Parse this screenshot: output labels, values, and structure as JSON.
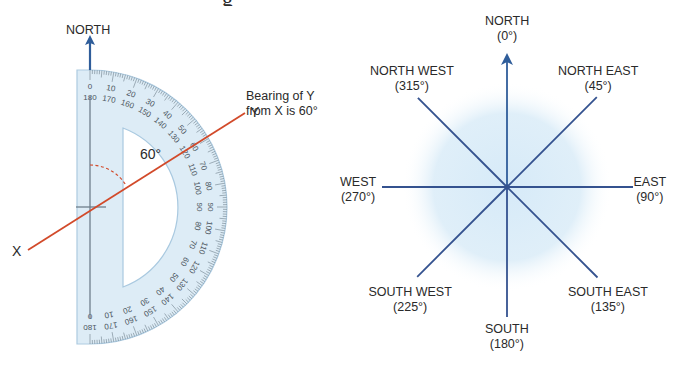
{
  "title_fragment": "g",
  "colors": {
    "north_arrow": "#2f5d9a",
    "compass_line": "#34528f",
    "bearing_line": "#d24a2a",
    "protractor_fill": "#dcecf6",
    "protractor_edge": "#a9c9e0",
    "tick": "#6f7f8c",
    "text": "#2a2a2a",
    "glow": "#cfe5f5"
  },
  "left_panel": {
    "north_label": "NORTH",
    "annotation_line1": "Bearing of Y",
    "annotation_line2": "from X is 60°",
    "point_x_label": "X",
    "point_y_label": "Y",
    "angle_label": "60°",
    "bearing_degrees": 60,
    "protractor": {
      "outer_scale": [
        0,
        10,
        20,
        30,
        40,
        50,
        60,
        70,
        80,
        90,
        100,
        110,
        120,
        130,
        140,
        150,
        160,
        170,
        180
      ],
      "inner_scale": [
        180,
        170,
        160,
        150,
        140,
        130,
        120,
        110,
        100,
        90,
        80,
        70,
        60,
        50,
        40,
        30,
        20,
        10,
        0
      ]
    }
  },
  "right_panel": {
    "directions": [
      {
        "name": "NORTH",
        "degrees": "(0°)",
        "angle": 0
      },
      {
        "name": "NORTH EAST",
        "degrees": "(45°)",
        "angle": 45
      },
      {
        "name": "EAST",
        "degrees": "(90°)",
        "angle": 90
      },
      {
        "name": "SOUTH EAST",
        "degrees": "(135°)",
        "angle": 135
      },
      {
        "name": "SOUTH",
        "degrees": "(180°)",
        "angle": 180
      },
      {
        "name": "SOUTH WEST",
        "degrees": "(225°)",
        "angle": 225
      },
      {
        "name": "WEST",
        "degrees": "(270°)",
        "angle": 270
      },
      {
        "name": "NORTH WEST",
        "degrees": "(315°)",
        "angle": 315
      }
    ]
  }
}
